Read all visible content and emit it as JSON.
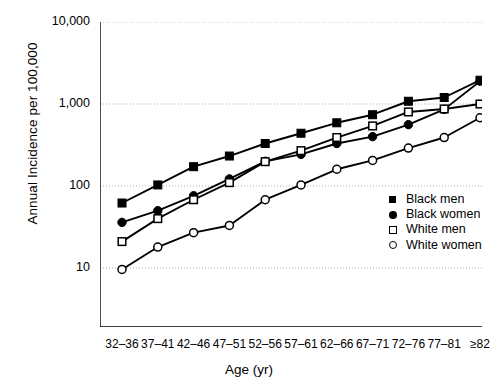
{
  "chart_data": {
    "type": "line",
    "title": "",
    "xlabel": "Age (yr)",
    "ylabel": "Annual Incidence per 100,000",
    "categories": [
      "32–36",
      "37–41",
      "42–46",
      "47–51",
      "52–56",
      "57–61",
      "62–66",
      "67–71",
      "72–76",
      "77–81",
      "≥82"
    ],
    "yscale": "log",
    "ylim": [
      3,
      10000
    ],
    "ytick_labels": [
      "10",
      "100",
      "1,000",
      "10,000"
    ],
    "ytick_values": [
      10,
      100,
      1000,
      10000
    ],
    "grid": "horizontal-dotted",
    "legend_position": "lower-right",
    "series": [
      {
        "name": "Black men",
        "marker": "filled-square",
        "values": [
          62,
          103,
          172,
          232,
          330,
          440,
          590,
          740,
          1080,
          1200,
          1950
        ]
      },
      {
        "name": "Black women",
        "marker": "filled-circle",
        "values": [
          36,
          50,
          76,
          122,
          200,
          243,
          330,
          400,
          560,
          860,
          1900
        ]
      },
      {
        "name": "White men",
        "marker": "open-square",
        "values": [
          21,
          40,
          68,
          110,
          198,
          270,
          390,
          540,
          800,
          870,
          1000
        ]
      },
      {
        "name": "White women",
        "marker": "open-circle",
        "values": [
          9.6,
          18,
          27,
          33,
          68,
          103,
          160,
          205,
          290,
          390,
          680
        ]
      }
    ]
  },
  "legend": {
    "items": [
      {
        "label": "Black men"
      },
      {
        "label": "Black women"
      },
      {
        "label": "White men"
      },
      {
        "label": "White women"
      }
    ]
  },
  "axes": {
    "x_title": "Age (yr)",
    "y_title": "Annual Incidence per 100,000"
  }
}
